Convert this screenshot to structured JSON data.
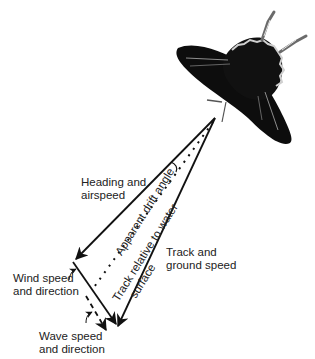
{
  "diagram": {
    "labels": {
      "heading": [
        "Heading and",
        "airspeed"
      ],
      "track_ground": [
        "Track and",
        "ground speed"
      ],
      "wind": [
        "Wind speed",
        "and direction"
      ],
      "wave": [
        "Wave speed",
        "and direction"
      ],
      "drift_angle": "Apparent drift angle",
      "track_water": [
        "Track relative to water",
        "surface"
      ]
    },
    "colors": {
      "line": "#111111",
      "butterfly_body": "#0d0d0d",
      "butterfly_vein": "#9a9a9a",
      "butterfly_highlight": "#d8d8d8"
    }
  }
}
